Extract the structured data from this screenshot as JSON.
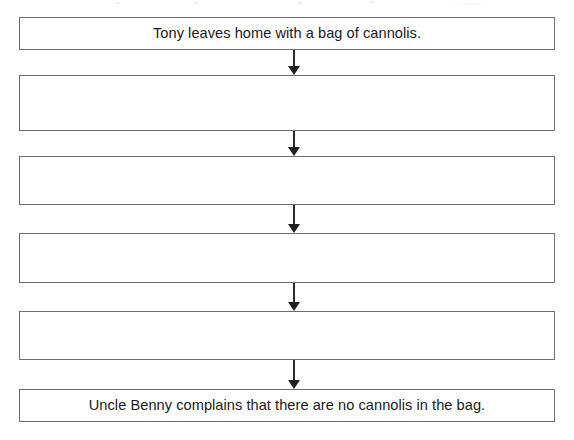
{
  "page": {
    "background_color": "#ffffff",
    "border_color": "#6f6f73",
    "text_color": "#1b1b1b",
    "arrow_color": "#1f1f1f",
    "width": 574,
    "height": 440
  },
  "flowchart": {
    "type": "vertical-sequence",
    "orientation": "top-to-bottom",
    "step_count": 6,
    "arrow_count": 5,
    "steps": [
      {
        "index": 1,
        "text": "Tony leaves home with a bag of cannolis.",
        "empty": false,
        "x": 19,
        "y": 17,
        "width": 536,
        "height": 33
      },
      {
        "index": 2,
        "text": "",
        "empty": true,
        "x": 19,
        "y": 75,
        "width": 536,
        "height": 56
      },
      {
        "index": 3,
        "text": "",
        "empty": true,
        "x": 19,
        "y": 156,
        "width": 536,
        "height": 49
      },
      {
        "index": 4,
        "text": "",
        "empty": true,
        "x": 19,
        "y": 233,
        "width": 536,
        "height": 50
      },
      {
        "index": 5,
        "text": "",
        "empty": true,
        "x": 19,
        "y": 311,
        "width": 536,
        "height": 49
      },
      {
        "index": 6,
        "text": "Uncle Benny complains that there are no cannolis in the bag.",
        "empty": false,
        "x": 19,
        "y": 389,
        "width": 536,
        "height": 33
      }
    ],
    "connectors": [
      {
        "index": 1,
        "from_step": 1,
        "to_step": 2,
        "x": 289,
        "y": 50,
        "length": 25,
        "icon": "arrow-down-icon"
      },
      {
        "index": 2,
        "from_step": 2,
        "to_step": 3,
        "x": 289,
        "y": 131,
        "length": 25,
        "icon": "arrow-down-icon"
      },
      {
        "index": 3,
        "from_step": 3,
        "to_step": 4,
        "x": 289,
        "y": 205,
        "length": 28,
        "icon": "arrow-down-icon"
      },
      {
        "index": 4,
        "from_step": 4,
        "to_step": 5,
        "x": 289,
        "y": 283,
        "length": 28,
        "icon": "arrow-down-icon"
      },
      {
        "index": 5,
        "from_step": 5,
        "to_step": 6,
        "x": 289,
        "y": 360,
        "length": 29,
        "icon": "arrow-down-icon"
      }
    ]
  }
}
